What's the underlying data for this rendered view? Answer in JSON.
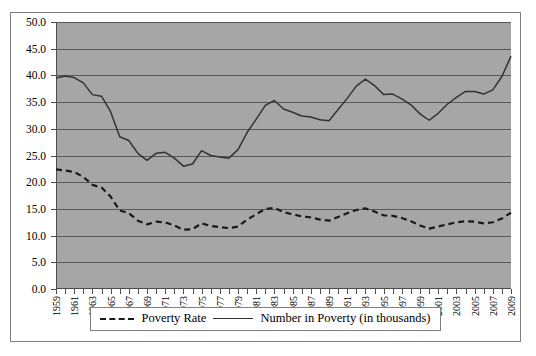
{
  "chart_data": {
    "type": "line",
    "title": "",
    "xlabel": "",
    "ylabel": "",
    "ylim": [
      0,
      50
    ],
    "ytick_step": 5,
    "grid": true,
    "legend_position": "bottom",
    "plot_background": "#a6a6a6",
    "ytick_labels": [
      "0.0",
      "5.0",
      "10.0",
      "15.0",
      "20.0",
      "25.0",
      "30.0",
      "35.0",
      "40.0",
      "45.0",
      "50.0"
    ],
    "x": [
      1959,
      1960,
      1961,
      1962,
      1963,
      1964,
      1965,
      1966,
      1967,
      1968,
      1969,
      1970,
      1971,
      1972,
      1973,
      1974,
      1975,
      1976,
      1977,
      1978,
      1979,
      1980,
      1981,
      1982,
      1983,
      1984,
      1985,
      1986,
      1987,
      1988,
      1989,
      1990,
      1991,
      1992,
      1993,
      1994,
      1995,
      1996,
      1997,
      1998,
      1999,
      2000,
      2001,
      2002,
      2003,
      2004,
      2005,
      2006,
      2007,
      2008,
      2009
    ],
    "xtick_labels": [
      "1959",
      "1961",
      "1963",
      "1965",
      "1967",
      "1969",
      "1971",
      "1973",
      "1975",
      "1977",
      "1979",
      "1981",
      "1983",
      "1985",
      "1987",
      "1989",
      "1991",
      "1993",
      "1995",
      "1997",
      "1999",
      "2001",
      "2003",
      "2005",
      "2007",
      "2009"
    ],
    "series": [
      {
        "name": "Poverty Rate",
        "style": "dashed",
        "color": "#1a1a1a",
        "values": [
          22.4,
          22.2,
          21.9,
          21.0,
          19.5,
          19.0,
          17.3,
          14.7,
          14.2,
          12.8,
          12.1,
          12.6,
          12.5,
          11.9,
          11.1,
          11.2,
          12.3,
          11.8,
          11.6,
          11.4,
          11.7,
          13.0,
          14.0,
          15.0,
          15.2,
          14.4,
          14.0,
          13.6,
          13.4,
          13.0,
          12.8,
          13.5,
          14.2,
          14.8,
          15.1,
          14.5,
          13.8,
          13.7,
          13.3,
          12.7,
          11.9,
          11.3,
          11.7,
          12.1,
          12.5,
          12.7,
          12.6,
          12.3,
          12.5,
          13.2,
          14.3
        ]
      },
      {
        "name": "Number in Poverty (in thousands)",
        "style": "solid",
        "color": "#333333",
        "values": [
          39.5,
          39.9,
          39.6,
          38.6,
          36.4,
          36.1,
          33.2,
          28.5,
          27.8,
          25.4,
          24.1,
          25.4,
          25.6,
          24.5,
          23.0,
          23.4,
          25.9,
          25.0,
          24.7,
          24.5,
          26.1,
          29.3,
          31.8,
          34.4,
          35.3,
          33.7,
          33.1,
          32.4,
          32.2,
          31.7,
          31.5,
          33.6,
          35.7,
          38.0,
          39.3,
          38.1,
          36.4,
          36.5,
          35.6,
          34.5,
          32.8,
          31.6,
          32.9,
          34.6,
          35.9,
          37.0,
          37.0,
          36.5,
          37.3,
          39.8,
          43.6
        ]
      }
    ]
  },
  "legend": {
    "entries": [
      {
        "label": "Poverty Rate",
        "style": "dashed"
      },
      {
        "label": "Number in Poverty (in thousands)",
        "style": "solid"
      }
    ]
  }
}
